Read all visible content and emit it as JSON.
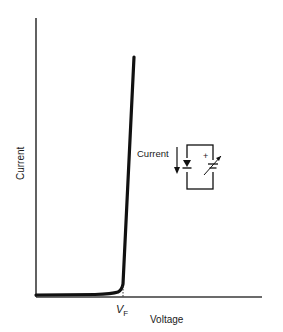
{
  "diagram": {
    "type": "diode-iv-characteristic",
    "x_axis_label": "Voltage",
    "y_axis_label": "Current",
    "threshold_label": "V",
    "threshold_subscript": "F",
    "inset": {
      "current_label": "Current",
      "polarity_sign": "+",
      "components": [
        "diode",
        "variable-voltage-source"
      ]
    },
    "colors": {
      "ink": "#1a1a1a",
      "axis": "#3a3a3a",
      "background": "#ffffff"
    }
  }
}
